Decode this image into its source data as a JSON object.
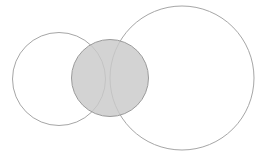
{
  "figure": {
    "canvas": {
      "width": 268,
      "height": 155,
      "background": "#ffffff"
    }
  },
  "chart_data": {
    "type": "diagram",
    "subtype": "venn",
    "title": "",
    "xlabel": "",
    "ylabel": "",
    "grid": false,
    "legend": null,
    "annotations": [],
    "shapes": [
      {
        "id": "left-circle",
        "name": "left-circle",
        "shape": "circle",
        "cx": 59,
        "cy": 79,
        "r": 46.5,
        "fill": "none",
        "fill_opacity": 0,
        "stroke": "#a6a6a6",
        "stroke_width": 1,
        "label": ""
      },
      {
        "id": "right-circle",
        "name": "right-circle",
        "shape": "circle",
        "cx": 182,
        "cy": 78,
        "r": 72,
        "fill": "none",
        "fill_opacity": 0,
        "stroke": "#a6a6a6",
        "stroke_width": 1,
        "label": ""
      },
      {
        "id": "center-circle",
        "name": "center-circle",
        "shape": "circle",
        "cx": 110,
        "cy": 78,
        "r": 38.5,
        "fill": "#c9c9c9",
        "fill_opacity": 0.82,
        "stroke": "#9b9b9b",
        "stroke_width": 1,
        "label": ""
      }
    ],
    "colors": {
      "shaded_fill": "#c9c9c9",
      "outline": "#a6a6a6",
      "center_outline": "#9b9b9b",
      "background": "#ffffff"
    }
  }
}
